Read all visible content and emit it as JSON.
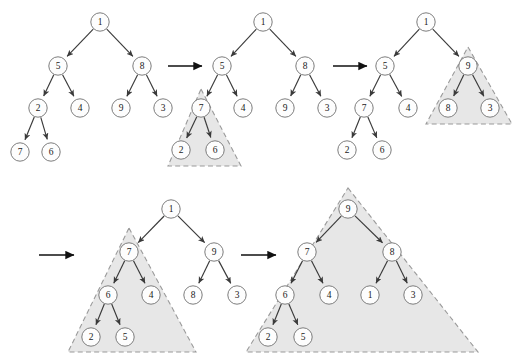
{
  "figure": {
    "colors": {
      "background": "#ffffff",
      "node_fill": "#fdfdfd",
      "node_stroke": "#6e6e6e",
      "edge": "#3a3a3a",
      "arrow": "#111111",
      "highlight_fill": "#e6e6e6",
      "highlight_stroke": "#9a9a9a"
    },
    "node_radius": 9.2
  },
  "trees": [
    {
      "id": "tree-1",
      "name": "initial-tree",
      "nodes": [
        {
          "label": "1",
          "x": 100,
          "y": 22
        },
        {
          "label": "5",
          "x": 58,
          "y": 66
        },
        {
          "label": "8",
          "x": 142,
          "y": 66
        },
        {
          "label": "2",
          "x": 38,
          "y": 108
        },
        {
          "label": "4",
          "x": 80,
          "y": 108
        },
        {
          "label": "9",
          "x": 121,
          "y": 108
        },
        {
          "label": "3",
          "x": 163,
          "y": 108
        },
        {
          "label": "7",
          "x": 20,
          "y": 152
        },
        {
          "label": "6",
          "x": 51,
          "y": 152
        }
      ],
      "edges": [
        [
          0,
          1
        ],
        [
          0,
          2
        ],
        [
          1,
          3
        ],
        [
          1,
          4
        ],
        [
          2,
          5
        ],
        [
          2,
          6
        ],
        [
          3,
          7
        ],
        [
          3,
          8
        ]
      ],
      "highlight": null
    },
    {
      "id": "tree-2",
      "name": "second-tree",
      "nodes": [
        {
          "label": "1",
          "x": 263,
          "y": 22
        },
        {
          "label": "5",
          "x": 222,
          "y": 66
        },
        {
          "label": "8",
          "x": 305,
          "y": 66
        },
        {
          "label": "7",
          "x": 201,
          "y": 108
        },
        {
          "label": "4",
          "x": 243,
          "y": 108
        },
        {
          "label": "9",
          "x": 285,
          "y": 108
        },
        {
          "label": "3",
          "x": 327,
          "y": 108
        },
        {
          "label": "2",
          "x": 181,
          "y": 150
        },
        {
          "label": "6",
          "x": 215,
          "y": 150
        }
      ],
      "edges": [
        [
          0,
          1
        ],
        [
          0,
          2
        ],
        [
          1,
          3
        ],
        [
          1,
          4
        ],
        [
          2,
          5
        ],
        [
          2,
          6
        ],
        [
          3,
          7
        ],
        [
          3,
          8
        ]
      ],
      "highlight": {
        "apex_x": 201,
        "apex_y": 89,
        "left_x": 168,
        "right_x": 241,
        "base_y": 166
      }
    },
    {
      "id": "tree-3",
      "name": "third-tree",
      "nodes": [
        {
          "label": "1",
          "x": 426,
          "y": 22
        },
        {
          "label": "5",
          "x": 385,
          "y": 66
        },
        {
          "label": "9",
          "x": 468,
          "y": 66
        },
        {
          "label": "7",
          "x": 364,
          "y": 108
        },
        {
          "label": "4",
          "x": 408,
          "y": 108
        },
        {
          "label": "8",
          "x": 448,
          "y": 108
        },
        {
          "label": "3",
          "x": 490,
          "y": 108
        },
        {
          "label": "2",
          "x": 347,
          "y": 150
        },
        {
          "label": "6",
          "x": 382,
          "y": 150
        }
      ],
      "edges": [
        [
          0,
          1
        ],
        [
          0,
          2
        ],
        [
          1,
          3
        ],
        [
          1,
          4
        ],
        [
          2,
          5
        ],
        [
          2,
          6
        ],
        [
          3,
          7
        ],
        [
          3,
          8
        ]
      ],
      "highlight": {
        "apex_x": 468,
        "apex_y": 47,
        "left_x": 426,
        "right_x": 512,
        "base_y": 124
      }
    },
    {
      "id": "tree-4",
      "name": "fourth-tree",
      "nodes": [
        {
          "label": "1",
          "x": 171,
          "y": 209
        },
        {
          "label": "7",
          "x": 129,
          "y": 252
        },
        {
          "label": "9",
          "x": 214,
          "y": 252
        },
        {
          "label": "6",
          "x": 108,
          "y": 295
        },
        {
          "label": "4",
          "x": 151,
          "y": 295
        },
        {
          "label": "8",
          "x": 193,
          "y": 295
        },
        {
          "label": "3",
          "x": 237,
          "y": 295
        },
        {
          "label": "2",
          "x": 91,
          "y": 337
        },
        {
          "label": "5",
          "x": 125,
          "y": 337
        }
      ],
      "edges": [
        [
          0,
          1
        ],
        [
          0,
          2
        ],
        [
          1,
          3
        ],
        [
          1,
          4
        ],
        [
          2,
          5
        ],
        [
          2,
          6
        ],
        [
          3,
          7
        ],
        [
          3,
          8
        ]
      ],
      "highlight": {
        "apex_x": 129,
        "apex_y": 228,
        "left_x": 68,
        "right_x": 196,
        "base_y": 352
      }
    },
    {
      "id": "tree-5",
      "name": "final-heap-tree",
      "nodes": [
        {
          "label": "9",
          "x": 348,
          "y": 209
        },
        {
          "label": "7",
          "x": 307,
          "y": 252
        },
        {
          "label": "8",
          "x": 392,
          "y": 252
        },
        {
          "label": "6",
          "x": 285,
          "y": 295
        },
        {
          "label": "4",
          "x": 329,
          "y": 295
        },
        {
          "label": "1",
          "x": 370,
          "y": 295
        },
        {
          "label": "3",
          "x": 413,
          "y": 295
        },
        {
          "label": "2",
          "x": 268,
          "y": 337
        },
        {
          "label": "5",
          "x": 303,
          "y": 337
        }
      ],
      "edges": [
        [
          0,
          1
        ],
        [
          0,
          2
        ],
        [
          1,
          3
        ],
        [
          1,
          4
        ],
        [
          2,
          5
        ],
        [
          2,
          6
        ],
        [
          3,
          7
        ],
        [
          3,
          8
        ]
      ],
      "highlight": {
        "apex_x": 348,
        "apex_y": 188,
        "left_x": 246,
        "right_x": 478,
        "base_y": 352
      }
    }
  ],
  "arrows": [
    {
      "name": "transition-arrow-1",
      "x1": 168,
      "y1": 66,
      "x2": 202,
      "y2": 66
    },
    {
      "name": "transition-arrow-2",
      "x1": 333,
      "y1": 66,
      "x2": 367,
      "y2": 66
    },
    {
      "name": "transition-arrow-3",
      "x1": 39,
      "y1": 255,
      "x2": 74,
      "y2": 255
    },
    {
      "name": "transition-arrow-4",
      "x1": 241,
      "y1": 255,
      "x2": 276,
      "y2": 255
    }
  ]
}
